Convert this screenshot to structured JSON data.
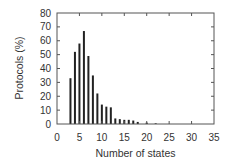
{
  "chart_data": {
    "type": "bar",
    "title": "",
    "xlabel": "Number of states",
    "ylabel": "Protocols (%)",
    "xlim": [
      0,
      35
    ],
    "ylim": [
      0,
      80
    ],
    "xticks": [
      0,
      5,
      10,
      15,
      20,
      25,
      30,
      35
    ],
    "yticks": [
      0,
      10,
      20,
      30,
      40,
      50,
      60,
      70,
      80
    ],
    "grid": false,
    "legend": null,
    "x": [
      3,
      4,
      5,
      6,
      7,
      8,
      9,
      10,
      11,
      12,
      13,
      14,
      15,
      16,
      17,
      18,
      20,
      22
    ],
    "values": [
      33,
      52,
      58,
      67,
      49,
      35,
      22,
      14,
      12.5,
      12,
      4,
      3.5,
      3,
      3,
      2.5,
      1.5,
      1,
      0.5
    ],
    "bar_color": "#222222",
    "axis_color": "#555555"
  }
}
